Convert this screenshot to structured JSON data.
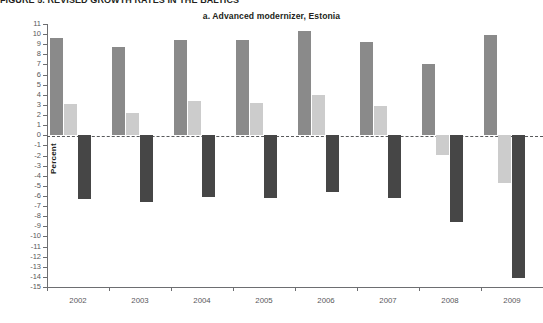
{
  "page": {
    "clipped_top_text": "FIGURE 5. REVISED GROWTH RATES IN THE BALTICS"
  },
  "chart_data": {
    "type": "bar",
    "title": "a. Advanced modernizer, Estonia",
    "xlabel": "",
    "ylabel": "Percent",
    "categories": [
      "2002",
      "2003",
      "2004",
      "2005",
      "2006",
      "2007",
      "2008",
      "2009"
    ],
    "ylim": [
      -15,
      11
    ],
    "ytick_labels": [
      "11",
      "10",
      "9",
      "8",
      "7",
      "6",
      "5",
      "4",
      "3",
      "2",
      "1",
      "0",
      "-1",
      "-2",
      "-3",
      "-4",
      "-5",
      "-6",
      "-7",
      "-8",
      "-9",
      "-10",
      "-11",
      "-12",
      "-13",
      "-14",
      "-15"
    ],
    "ytick_values": [
      11,
      10,
      9,
      8,
      7,
      6,
      5,
      4,
      3,
      2,
      1,
      0,
      -1,
      -2,
      -3,
      -4,
      -5,
      -6,
      -7,
      -8,
      -9,
      -10,
      -11,
      -12,
      -13,
      -14,
      -15
    ],
    "grid": false,
    "zero_line": true,
    "zero_line_style": "dashed",
    "legend": "none",
    "series": [
      {
        "name": "series-1",
        "color": "#8a8a8a",
        "values": [
          9.6,
          8.7,
          9.4,
          9.4,
          10.3,
          9.2,
          7.0,
          9.9
        ]
      },
      {
        "name": "series-2",
        "color": "#cccccc",
        "values": [
          3.1,
          2.2,
          3.4,
          3.2,
          4.0,
          2.9,
          -2.0,
          -4.7
        ]
      },
      {
        "name": "series-3",
        "color": "#464646",
        "values": [
          -6.3,
          -6.6,
          -6.1,
          -6.2,
          -5.6,
          -6.2,
          -8.6,
          -14.1
        ]
      }
    ]
  }
}
